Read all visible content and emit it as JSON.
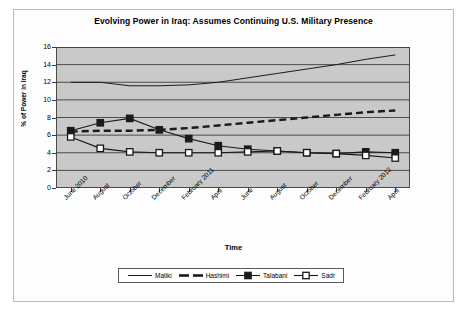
{
  "chart_data": {
    "type": "line",
    "title": "Evolving Power in Iraq: Assumes Continuing U.S. Military Presence",
    "xlabel": "Time",
    "ylabel": "% of Power in Iraq",
    "ylim": [
      0,
      16
    ],
    "yticks": [
      0,
      2,
      4,
      6,
      8,
      10,
      12,
      14,
      16
    ],
    "grid": true,
    "legend_position": "bottom",
    "categories": [
      "June 2010",
      "August",
      "October",
      "December",
      "February 2011",
      "April",
      "June",
      "August",
      "October",
      "December",
      "February 2012",
      "April"
    ],
    "series": [
      {
        "name": "Maliki",
        "style": "solid-thin",
        "marker": "none",
        "color": "#1a1a1a",
        "values": [
          12.0,
          12.0,
          11.6,
          11.6,
          11.7,
          12.0,
          12.5,
          13.0,
          13.5,
          14.0,
          14.6,
          15.1
        ]
      },
      {
        "name": "Hashimi",
        "style": "dashed-thick",
        "marker": "none",
        "color": "#1a1a1a",
        "values": [
          6.4,
          6.5,
          6.5,
          6.6,
          6.8,
          7.1,
          7.4,
          7.7,
          8.0,
          8.3,
          8.6,
          8.8
        ]
      },
      {
        "name": "Talabani",
        "style": "solid",
        "marker": "filled-square",
        "color": "#1a1a1a",
        "values": [
          6.5,
          7.4,
          7.9,
          6.6,
          5.6,
          4.8,
          4.4,
          4.2,
          4.0,
          3.9,
          4.1,
          4.0
        ]
      },
      {
        "name": "Sadr",
        "style": "solid",
        "marker": "open-square",
        "color": "#1a1a1a",
        "values": [
          5.8,
          4.5,
          4.1,
          4.0,
          4.0,
          4.0,
          4.1,
          4.2,
          4.0,
          3.9,
          3.7,
          3.4
        ]
      }
    ]
  },
  "legend": {
    "items": [
      {
        "label": "Maliki",
        "swatch": "line-thin-icon"
      },
      {
        "label": "Hashimi",
        "swatch": "line-dashed-thick-icon"
      },
      {
        "label": "Talabani",
        "swatch": "line-filled-square-icon"
      },
      {
        "label": "Sadr",
        "swatch": "line-open-square-icon"
      }
    ]
  }
}
